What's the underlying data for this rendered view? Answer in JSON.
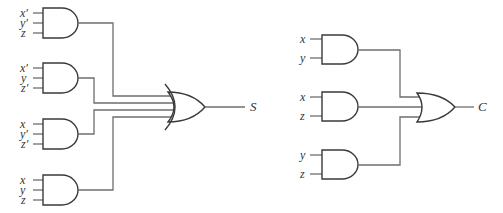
{
  "diagram": {
    "title": "",
    "circuits": [
      {
        "name": "sum-circuit",
        "output_label": "S",
        "and_gates": [
          {
            "inputs": [
              "x′",
              "y′",
              "z"
            ]
          },
          {
            "inputs": [
              "x′",
              "y",
              "z′"
            ]
          },
          {
            "inputs": [
              "x",
              "y′",
              "z′"
            ]
          },
          {
            "inputs": [
              "x",
              "y",
              "z"
            ]
          }
        ],
        "or_gate": {
          "inputs": 4,
          "output": "S"
        }
      },
      {
        "name": "carry-circuit",
        "output_label": "C",
        "and_gates": [
          {
            "inputs": [
              "x",
              "y"
            ]
          },
          {
            "inputs": [
              "x",
              "z"
            ]
          },
          {
            "inputs": [
              "y",
              "z"
            ]
          }
        ],
        "or_gate": {
          "inputs": 3,
          "output": "C"
        }
      }
    ]
  }
}
